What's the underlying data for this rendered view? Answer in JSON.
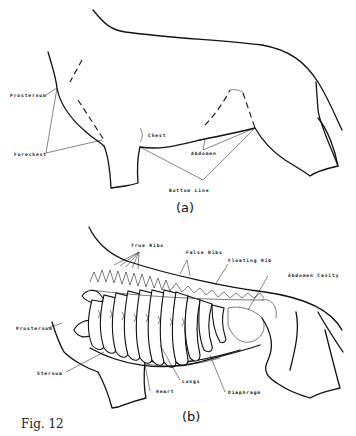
{
  "figure": {
    "caption": "Fig. 12",
    "panel_a": {
      "label": "(a)",
      "labels": {
        "prosternum": "Prosternum",
        "forechest": "Forechest",
        "chest": "Chest",
        "abdomen": "Abdomen",
        "bottom_line": "Bottom Line"
      }
    },
    "panel_b": {
      "label": "(b)",
      "labels": {
        "true_ribs": "True Ribs",
        "false_ribs": "False Ribs",
        "floating_rib": "Floating Rib",
        "abdomen_cavity": "Abdomen Cavity",
        "prosternum": "Prosternum",
        "sternum": "Sternum",
        "lungs": "Lungs",
        "heart": "Heart",
        "diaphragm": "Diaphragm"
      }
    }
  },
  "colors": {
    "ink": "#111111",
    "background": "#ffffff"
  }
}
